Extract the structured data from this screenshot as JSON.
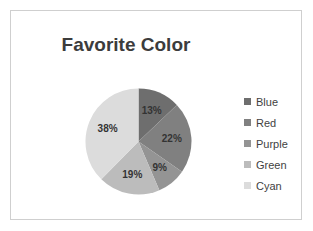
{
  "slide": {
    "background_color": "#ffffff",
    "border_color": "#cfcfcf"
  },
  "chart_data": {
    "type": "pie",
    "title": "Favorite Color",
    "xlabel": "",
    "ylabel": "",
    "legend_position": "right",
    "grid": false,
    "start_angle_oclock": 12,
    "direction": "clockwise",
    "categories": [
      "Blue",
      "Red",
      "Purple",
      "Green",
      "Cyan"
    ],
    "values": [
      13,
      22,
      9,
      19,
      38
    ],
    "value_unit": "%",
    "data_labels": [
      "13%",
      "22%",
      "9%",
      "19%",
      "38%"
    ],
    "colors": [
      "#6e6e6e",
      "#808080",
      "#949494",
      "#bcbcbc",
      "#dcdcdc"
    ],
    "label_color": "#333333",
    "title_color": "#3c3c3c"
  },
  "legend": {
    "items": [
      {
        "label": "Blue",
        "color": "#6e6e6e"
      },
      {
        "label": "Red",
        "color": "#808080"
      },
      {
        "label": "Purple",
        "color": "#949494"
      },
      {
        "label": "Green",
        "color": "#bcbcbc"
      },
      {
        "label": "Cyan",
        "color": "#dcdcdc"
      }
    ]
  }
}
